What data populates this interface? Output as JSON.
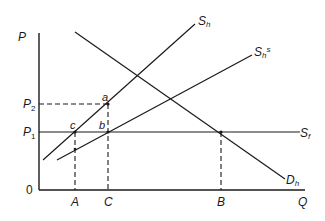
{
  "diagram": {
    "type": "supply-demand",
    "axes": {
      "y_label": "P",
      "x_label": "Q",
      "origin_label": "0"
    },
    "price_levels": [
      {
        "label": "P",
        "sub": "2",
        "y": 104
      },
      {
        "label": "P",
        "sub": "1",
        "y": 132
      }
    ],
    "quantity_levels": [
      {
        "label": "A",
        "x": 75
      },
      {
        "label": "C",
        "x": 108
      },
      {
        "label": "B",
        "x": 221
      }
    ],
    "curves": [
      {
        "name": "home-supply",
        "label": "S",
        "sub": "h",
        "sup": ""
      },
      {
        "name": "subsidized-home-supply",
        "label": "S",
        "sub": "h",
        "sup": "s"
      },
      {
        "name": "foreign-supply",
        "label": "S",
        "sub": "f",
        "sup": ""
      },
      {
        "name": "home-demand",
        "label": "D",
        "sub": "h",
        "sup": ""
      }
    ],
    "points": [
      {
        "label": "a"
      },
      {
        "label": "b"
      },
      {
        "label": "c"
      }
    ],
    "colors": {
      "ink": "#1a1a1a",
      "background": "#ffffff"
    }
  }
}
